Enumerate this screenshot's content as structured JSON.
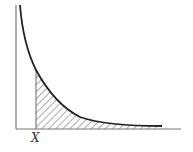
{
  "diagram": {
    "type": "decay-curve-with-shaded-tail",
    "x_marker_label": "X",
    "colors": {
      "axis": "#777777",
      "curve": "#222222",
      "hatch": "#555555",
      "background": "#ffffff"
    }
  }
}
